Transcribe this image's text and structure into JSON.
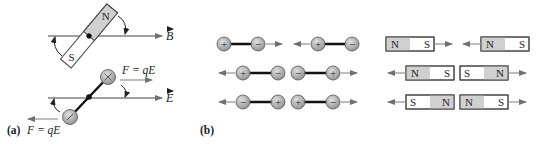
{
  "figure": {
    "panel_a": {
      "label": "(a)",
      "magnet": {
        "north": "N",
        "south": "S"
      },
      "field_b_label": "B",
      "field_e_label": "E",
      "force_top_label": "F = qE",
      "force_bottom_label": "F = qE",
      "top_charge": "+",
      "bottom_charge": "−"
    },
    "panel_b": {
      "label": "(b)",
      "dipoles": [
        {
          "row": 1,
          "left": "+",
          "right": "−",
          "arrow": "right"
        },
        {
          "row": 1,
          "left": "+",
          "right": "−",
          "arrow": "left"
        },
        {
          "row": 2,
          "left": "+",
          "right": "−",
          "arrow": "left"
        },
        {
          "row": 2,
          "left": "−",
          "right": "+",
          "arrow": "right"
        },
        {
          "row": 3,
          "left": "−",
          "right": "+",
          "arrow": "left"
        },
        {
          "row": 3,
          "left": "+",
          "right": "−",
          "arrow": "right"
        }
      ],
      "magnets": [
        {
          "row": 1,
          "left": "N",
          "right": "S",
          "arrow": "right"
        },
        {
          "row": 1,
          "left": "N",
          "right": "S",
          "arrow": "left"
        },
        {
          "row": 2,
          "left": "N",
          "right": "S",
          "arrow": "left"
        },
        {
          "row": 2,
          "left": "S",
          "right": "N",
          "arrow": "right"
        },
        {
          "row": 3,
          "left": "S",
          "right": "N",
          "arrow": "left"
        },
        {
          "row": 3,
          "left": "N",
          "right": "S",
          "arrow": "right"
        }
      ]
    },
    "colors": {
      "line": "#808080",
      "charge_fill": "#b0b0b0",
      "magnet_north_fill": "#d0d0d0",
      "magnet_border": "#444444",
      "rod": "#111111"
    }
  }
}
